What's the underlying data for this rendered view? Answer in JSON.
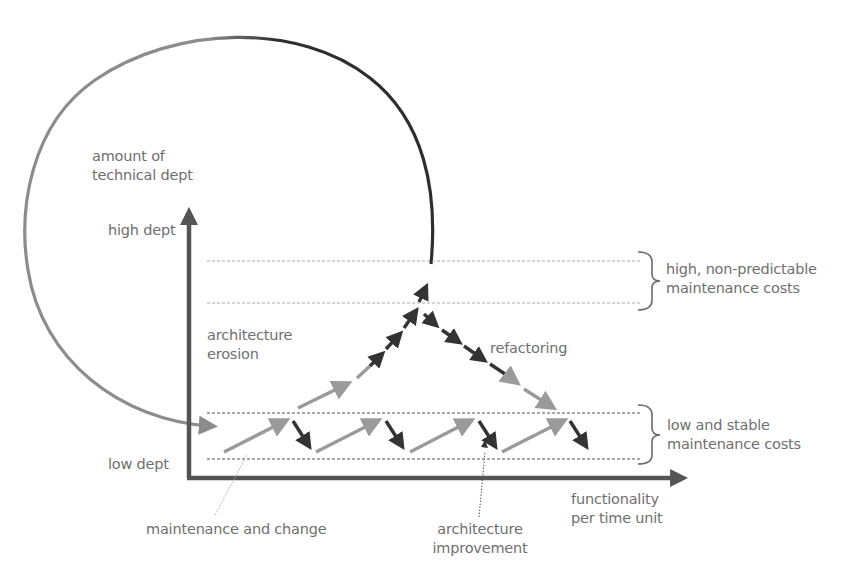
{
  "diagram": {
    "colors": {
      "background": "#ffffff",
      "axis": "#545454",
      "light_arrow": "#9a9a9a",
      "dark_arrow": "#333333",
      "circle_light": "#8c8c8c",
      "circle_dark": "#2e2e2e",
      "dashed_line_dark": "#555555",
      "dashed_line_light": "#a8a8a8",
      "label_text": "#6f6f6f",
      "bracket": "#6a6a6a"
    },
    "y_axis": {
      "title_line1": "amount of",
      "title_line2": "technical dept",
      "high_label": "high dept",
      "low_label": "low dept"
    },
    "x_axis": {
      "title_line1": "functionality",
      "title_line2": "per time unit"
    },
    "zones": {
      "high": {
        "label_line1": "high, non-predictable",
        "label_line2": "maintenance costs"
      },
      "low": {
        "label_line1": "low and stable",
        "label_line2": "maintenance costs"
      }
    },
    "process_labels": {
      "erosion_line1": "architecture",
      "erosion_line2": "erosion",
      "refactoring": "refactoring",
      "maintenance": "maintenance and change",
      "improvement_line1": "architecture",
      "improvement_line2": "improvement"
    }
  }
}
